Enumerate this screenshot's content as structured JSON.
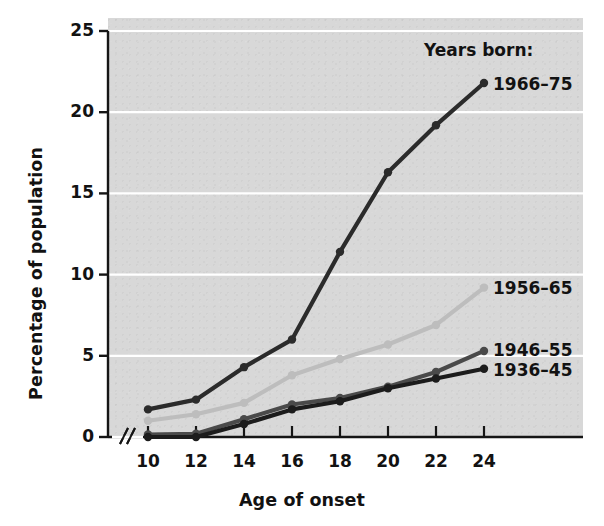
{
  "chart_data": {
    "type": "line",
    "title": "",
    "xlabel": "Age of onset",
    "ylabel": "Percentage of population",
    "legend_title": "Years born:",
    "legend_position": "right-inline",
    "grid": "horizontal-white",
    "xlim": [
      10,
      24
    ],
    "ylim": [
      0,
      25
    ],
    "xticks": [
      10,
      12,
      14,
      16,
      18,
      20,
      22,
      24
    ],
    "yticks": [
      0,
      5,
      10,
      15,
      20,
      25
    ],
    "axis_break": true,
    "x": [
      10,
      12,
      14,
      16,
      18,
      20,
      22,
      24
    ],
    "series": [
      {
        "name": "1966–75",
        "color": "#2b2b2b",
        "values": [
          1.7,
          2.3,
          4.3,
          6.0,
          11.4,
          16.3,
          19.2,
          21.8
        ]
      },
      {
        "name": "1956–65",
        "color": "#bdbdbd",
        "values": [
          1.0,
          1.4,
          2.1,
          3.8,
          4.8,
          5.7,
          6.9,
          9.2
        ]
      },
      {
        "name": "1946–55",
        "color": "#4a4a4a",
        "values": [
          0.15,
          0.2,
          1.1,
          2.0,
          2.4,
          3.1,
          4.0,
          5.3
        ]
      },
      {
        "name": "1936–45",
        "color": "#1c1c1c",
        "values": [
          0.0,
          0.0,
          0.8,
          1.7,
          2.2,
          3.0,
          3.6,
          4.2
        ]
      }
    ]
  },
  "axis": {
    "xlabel": "Age of onset",
    "ylabel": "Percentage of population",
    "xticks": [
      "10",
      "12",
      "14",
      "16",
      "18",
      "20",
      "22",
      "24"
    ],
    "yticks": [
      "0",
      "5",
      "10",
      "15",
      "20",
      "25"
    ]
  },
  "legend": {
    "title": "Years born:",
    "items": [
      {
        "label": "1966–75"
      },
      {
        "label": "1956–65"
      },
      {
        "label": "1946–55"
      },
      {
        "label": "1936–45"
      }
    ]
  },
  "colors": {
    "panel": "#d8d8d8",
    "gridline": "#ffffff",
    "axis": "#151515",
    "series_1966_75": "#2b2b2b",
    "series_1956_65": "#bdbdbd",
    "series_1946_55": "#4a4a4a",
    "series_1936_45": "#1c1c1c"
  }
}
